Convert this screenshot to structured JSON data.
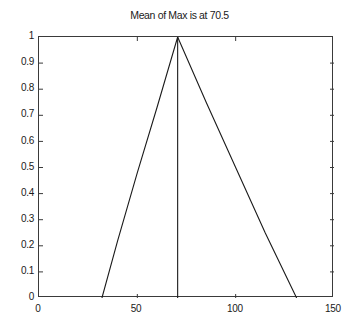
{
  "chart_data": {
    "type": "line",
    "title": "Mean of Max is at 70.5",
    "xlabel": "",
    "ylabel": "",
    "xlim": [
      0,
      150
    ],
    "ylim": [
      0,
      1
    ],
    "xticks": [
      0,
      50,
      100,
      150
    ],
    "yticks": [
      0,
      0.1,
      0.2,
      0.3,
      0.4,
      0.5,
      0.6,
      0.7,
      0.8,
      0.9,
      1
    ],
    "xtick_labels": [
      "0",
      "50",
      "100",
      "150"
    ],
    "ytick_labels": [
      "0",
      "0.1",
      "0.2",
      "0.3",
      "0.4",
      "0.5",
      "0.6",
      "0.7",
      "0.8",
      "0.9",
      "1"
    ],
    "grid": false,
    "legend": null,
    "box": true,
    "series": [
      {
        "name": "rising-edge",
        "color": "#1a1a1a",
        "x": [
          32,
          40,
          50,
          60,
          70.5
        ],
        "y": [
          0,
          0.22,
          0.48,
          0.73,
          1.0
        ]
      },
      {
        "name": "peak-marker",
        "color": "#1a1a1a",
        "x": [
          70.5,
          70.5
        ],
        "y": [
          0,
          1.0
        ]
      },
      {
        "name": "falling-edge",
        "color": "#1a1a1a",
        "x": [
          70.5,
          85,
          100,
          115,
          131
        ],
        "y": [
          1.0,
          0.75,
          0.5,
          0.25,
          0
        ]
      }
    ],
    "annotations": [
      {
        "name": "mean-of-max",
        "value": 70.5
      }
    ]
  },
  "axes": {
    "axis_color": "#3a3a3a",
    "background": "#ffffff",
    "tick_direction": "in"
  }
}
